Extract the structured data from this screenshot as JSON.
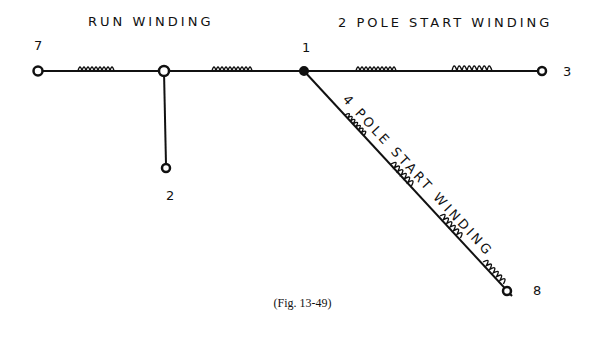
{
  "diagram": {
    "labels": {
      "run_winding": "RUN WINDING",
      "two_pole_start": "2 POLE START WINDING",
      "four_pole_start": "4 POLE START WINDING"
    },
    "terminals": {
      "t7": "7",
      "t1": "1",
      "t3": "3",
      "t2": "2",
      "t8": "8"
    },
    "caption": "(Fig. 13-49)"
  }
}
